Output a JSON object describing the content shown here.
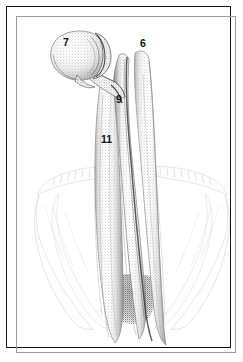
{
  "figure": {
    "kind": "anatomical-stipple-illustration",
    "caption": "",
    "frame": {
      "border_color": "#141414",
      "inner_border_color": "#9a9a9a",
      "background_color": "#ffffff"
    },
    "palette": {
      "ink": "#111111",
      "stipple_dark": "#3a3a3a",
      "stipple_mid": "#8e8e8e",
      "stipple_light": "#c9c9c9",
      "stipple_faint": "#e3e3e3",
      "paper": "#ffffff"
    },
    "labels": [
      {
        "id": "7",
        "text": "7",
        "x": 56,
        "y": 30,
        "refers_to": "bulbous terminal structure, upper left"
      },
      {
        "id": "6",
        "text": "6",
        "x": 133,
        "y": 31,
        "refers_to": "right vertical tube, upper"
      },
      {
        "id": "9",
        "text": "9",
        "x": 109,
        "y": 87,
        "refers_to": "central junction of tubes"
      },
      {
        "id": "11",
        "text": "11",
        "x": 94,
        "y": 127,
        "refers_to": "long vertical shaft, mid"
      }
    ],
    "parts": [
      {
        "name": "bulb",
        "label": "7"
      },
      {
        "name": "right-tube",
        "label": "6"
      },
      {
        "name": "junction",
        "label": "9"
      },
      {
        "name": "shaft",
        "label": "11"
      },
      {
        "name": "faint-lateral-wings",
        "label": ""
      },
      {
        "name": "stippled-basal-mass",
        "label": ""
      }
    ]
  }
}
